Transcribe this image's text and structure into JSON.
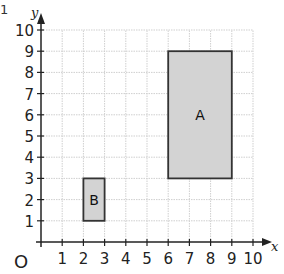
{
  "question_number": "1",
  "axes": {
    "x_label": "x",
    "y_label": "y",
    "origin_label": "O",
    "x_ticks": [
      "1",
      "2",
      "3",
      "4",
      "5",
      "6",
      "7",
      "8",
      "9",
      "10"
    ],
    "y_ticks": [
      "1",
      "2",
      "3",
      "4",
      "5",
      "6",
      "7",
      "8",
      "9",
      "10"
    ]
  },
  "shapes": [
    {
      "label": "A",
      "x1": 6,
      "y1": 3,
      "x2": 9,
      "y2": 9,
      "fill": "#d3d3d3",
      "stroke": "#333333"
    },
    {
      "label": "B",
      "x1": 2,
      "y1": 1,
      "x2": 3,
      "y2": 3,
      "fill": "#d3d3d3",
      "stroke": "#333333"
    }
  ],
  "colors": {
    "grid": "#cfcfcf",
    "axis": "#222222"
  }
}
